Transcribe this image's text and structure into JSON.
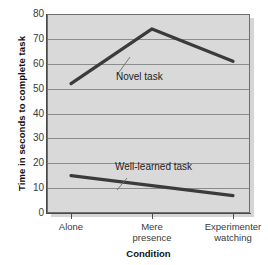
{
  "chart_data": {
    "type": "line",
    "title": "",
    "xlabel": "Condition",
    "ylabel": "Time in seconds to complete task",
    "categories": [
      "Alone",
      "Mere presence",
      "Experimenter watching"
    ],
    "category_lines": [
      [
        "Alone"
      ],
      [
        "Mere",
        "presence"
      ],
      [
        "Experimenter",
        "watching"
      ]
    ],
    "series": [
      {
        "name": "Novel task",
        "values": [
          52,
          74,
          61
        ]
      },
      {
        "name": "Well-learned task",
        "values": [
          15,
          11,
          7
        ]
      }
    ],
    "ylim": [
      0,
      80
    ],
    "yticks": [
      0,
      10,
      20,
      30,
      40,
      50,
      60,
      70,
      80
    ],
    "ytick_labels": [
      "0",
      "10",
      "20",
      "30",
      "40",
      "50",
      "60",
      "70",
      "80"
    ],
    "grid": true,
    "legend_position": "inline-annotations",
    "annotations": [
      {
        "text": "Novel task",
        "series": "Novel task"
      },
      {
        "text": "Well-learned task",
        "series": "Well-learned task"
      }
    ],
    "colors": {
      "plot_background": "#d9d9d9",
      "gridline": "#8c8c8c",
      "series_line": "#3b3b3b",
      "axis": "#4a4a4a",
      "text": "#1d1d1d"
    }
  }
}
